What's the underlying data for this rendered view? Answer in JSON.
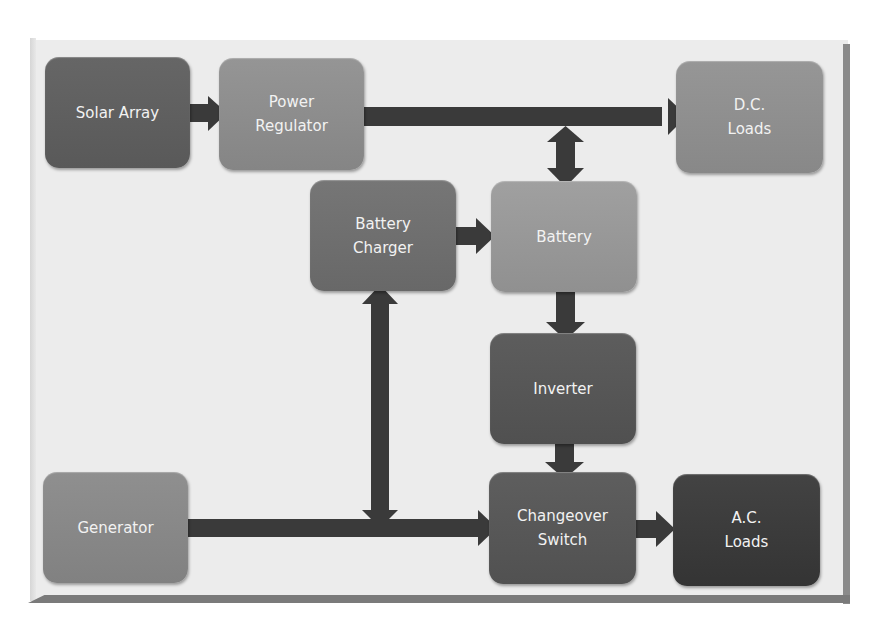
{
  "diagram": {
    "title": "",
    "nodes": [
      {
        "id": "solar_array",
        "label": "Solar Array",
        "color": "#5f5f5f"
      },
      {
        "id": "power_regulator",
        "label": "Power\nRegulator",
        "color": "#8d8d8d"
      },
      {
        "id": "dc_loads",
        "label": "D.C.\nLoads",
        "color": "#8f8f8f"
      },
      {
        "id": "battery_charger",
        "label": "Battery\nCharger",
        "color": "#6f6f6f"
      },
      {
        "id": "battery",
        "label": "Battery",
        "color": "#989898"
      },
      {
        "id": "inverter",
        "label": "Inverter",
        "color": "#565656"
      },
      {
        "id": "generator",
        "label": "Generator",
        "color": "#888888"
      },
      {
        "id": "changeover_switch",
        "label": "Changeover\nSwitch",
        "color": "#575757"
      },
      {
        "id": "ac_loads",
        "label": "A.C.\nLoads",
        "color": "#3b3b3b"
      }
    ],
    "edges": [
      {
        "from": "solar_array",
        "to": "power_regulator",
        "type": "one-way"
      },
      {
        "from": "power_regulator",
        "to": "dc_loads",
        "type": "one-way"
      },
      {
        "from": "power_regulator_dc_bus",
        "to": "battery",
        "type": "two-way"
      },
      {
        "from": "battery_charger",
        "to": "battery",
        "type": "one-way"
      },
      {
        "from": "battery",
        "to": "inverter",
        "type": "one-way"
      },
      {
        "from": "inverter",
        "to": "changeover_switch",
        "type": "one-way"
      },
      {
        "from": "generator",
        "to": "changeover_switch",
        "type": "one-way"
      },
      {
        "from": "generator_ac_bus",
        "to": "battery_charger",
        "type": "two-way"
      },
      {
        "from": "changeover_switch",
        "to": "ac_loads",
        "type": "one-way"
      }
    ],
    "arrow_color": "#3a3a3a",
    "frame_color": "#ececec"
  }
}
